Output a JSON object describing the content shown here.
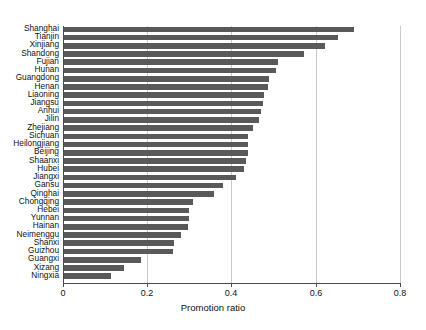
{
  "chart_data": {
    "type": "bar",
    "orientation": "horizontal",
    "title": "",
    "xlabel": "Promotion ratio",
    "ylabel": "",
    "xlim": [
      0,
      0.8
    ],
    "ylim": null,
    "grid": "vertical gridlines at x ticks",
    "legend": "none",
    "xticks": [
      "0",
      "0.2",
      "0.4",
      "0.6",
      "0.8"
    ],
    "xtick_values": [
      0,
      0.2,
      0.4,
      0.6,
      0.8
    ],
    "bar_color": "#595959",
    "categories": [
      "Shanghai",
      "Tianjin",
      "Xinjiang",
      "Shandong",
      "Fujian",
      "Hunan",
      "Guangdong",
      "Henan",
      "Liaoning",
      "Jiangsu",
      "Anhui",
      "Jilin",
      "Zhejiang",
      "Sichuan",
      "Heilongjiang",
      "Beijing",
      "Shaanxi",
      "Hubei",
      "Jiangxi",
      "Gansu",
      "Qinghai",
      "Chongqing",
      "Hebei",
      "Yunnan",
      "Hainan",
      "Neimenggu",
      "Shanxi",
      "Guizhou",
      "Guangxi",
      "Xizang",
      "Ningxia"
    ],
    "values": [
      0.688,
      0.652,
      0.621,
      0.571,
      0.509,
      0.504,
      0.486,
      0.484,
      0.474,
      0.473,
      0.468,
      0.463,
      0.45,
      0.438,
      0.437,
      0.437,
      0.433,
      0.427,
      0.409,
      0.378,
      0.357,
      0.307,
      0.298,
      0.297,
      0.295,
      0.277,
      0.262,
      0.26,
      0.183,
      0.143,
      0.112
    ]
  },
  "axis": {
    "xlabel": "Promotion ratio"
  }
}
